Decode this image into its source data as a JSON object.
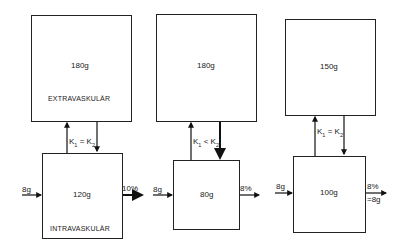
{
  "panels": [
    {
      "extravascular": {
        "amount": "180g",
        "label": "EXTRAVASKULÄR"
      },
      "exchange": {
        "k1": "K",
        "k1_sub": "1",
        "relation": " = ",
        "k2": "K",
        "k2_sub": "2"
      },
      "intravascular": {
        "amount": "120g",
        "label": "INTRAVASKULÄR"
      },
      "input": "8g",
      "output": "10%"
    },
    {
      "extravascular": {
        "amount": "180g"
      },
      "exchange": {
        "k1": "K",
        "k1_sub": "1",
        "relation": " < ",
        "k2": "K",
        "k2_sub": "2"
      },
      "intravascular": {
        "amount": "80g"
      },
      "input": "8g",
      "output": "8%"
    },
    {
      "extravascular": {
        "amount": "150g"
      },
      "exchange": {
        "k1": "K",
        "k1_sub": "1",
        "relation": " = ",
        "k2": "K",
        "k2_sub": "2"
      },
      "intravascular": {
        "amount": "100g"
      },
      "input": "8g",
      "output": "8%",
      "output_note": "=8g"
    }
  ]
}
